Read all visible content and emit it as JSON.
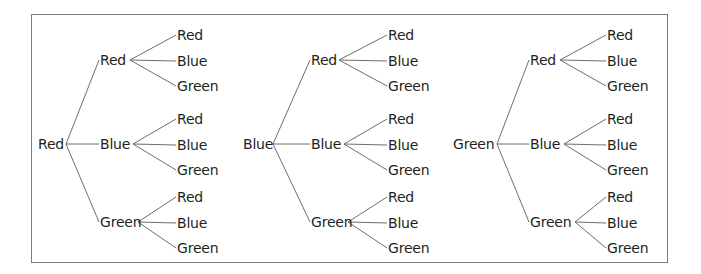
{
  "diagram": {
    "type": "tree",
    "line_color": "#6d6d6d",
    "frame_color": "#7a7a7a",
    "trees": [
      {
        "root": "Red",
        "branches": [
          {
            "label": "Red",
            "leaves": [
              "Red",
              "Blue",
              "Green"
            ]
          },
          {
            "label": "Blue",
            "leaves": [
              "Red",
              "Blue",
              "Green"
            ]
          },
          {
            "label": "Green",
            "leaves": [
              "Red",
              "Blue",
              "Green"
            ]
          }
        ]
      },
      {
        "root": "Blue",
        "branches": [
          {
            "label": "Red",
            "leaves": [
              "Red",
              "Blue",
              "Green"
            ]
          },
          {
            "label": "Blue",
            "leaves": [
              "Red",
              "Blue",
              "Green"
            ]
          },
          {
            "label": "Green",
            "leaves": [
              "Red",
              "Blue",
              "Green"
            ]
          }
        ]
      },
      {
        "root": "Green",
        "branches": [
          {
            "label": "Red",
            "leaves": [
              "Red",
              "Blue",
              "Green"
            ]
          },
          {
            "label": "Blue",
            "leaves": [
              "Red",
              "Blue",
              "Green"
            ]
          },
          {
            "label": "Green",
            "leaves": [
              "Red",
              "Blue",
              "Green"
            ]
          }
        ]
      }
    ]
  }
}
